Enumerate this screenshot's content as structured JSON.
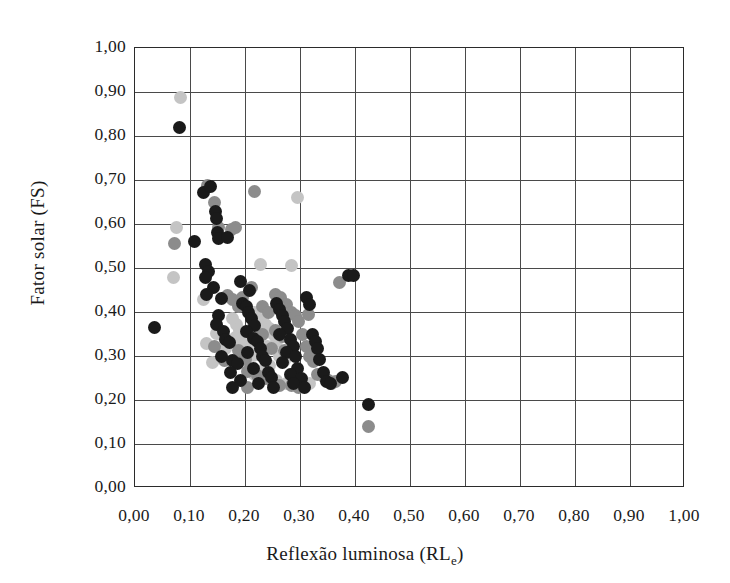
{
  "chart_data": {
    "type": "scatter",
    "title": "",
    "xlabel": "Reflexão luminosa (RL",
    "xlabel_sub": "e",
    "xlabel_suffix": ")",
    "ylabel": "Fator solar (FS)",
    "xlim": [
      0.0,
      1.0
    ],
    "ylim": [
      0.0,
      1.0
    ],
    "xticks": [
      "0,00",
      "0,10",
      "0,20",
      "0,30",
      "0,40",
      "0,50",
      "0,60",
      "0,70",
      "0,80",
      "0,90",
      "1,00"
    ],
    "yticks": [
      "0,00",
      "0,10",
      "0,20",
      "0,30",
      "0,40",
      "0,50",
      "0,60",
      "0,70",
      "0,80",
      "0,90",
      "1,00"
    ],
    "xtick_values": [
      0.0,
      0.1,
      0.2,
      0.3,
      0.4,
      0.5,
      0.6,
      0.7,
      0.8,
      0.9,
      1.0
    ],
    "ytick_values": [
      0.0,
      0.1,
      0.2,
      0.3,
      0.4,
      0.5,
      0.6,
      0.7,
      0.8,
      0.9,
      1.0
    ],
    "grid": true,
    "legend": "none",
    "marker_size_px": 13,
    "colors": {
      "dark": "#1a1a1a",
      "medium": "#8c8c8c",
      "light": "#c4c4c4",
      "grid": "#4a4a4a",
      "frame": "#2b2b2b",
      "background": "#ffffff"
    },
    "series": [
      {
        "name": "dark",
        "color": "#1a1a1a",
        "points": [
          [
            0.08,
            0.82
          ],
          [
            0.035,
            0.365
          ],
          [
            0.125,
            0.672
          ],
          [
            0.137,
            0.685
          ],
          [
            0.147,
            0.628
          ],
          [
            0.148,
            0.612
          ],
          [
            0.15,
            0.58
          ],
          [
            0.152,
            0.568
          ],
          [
            0.168,
            0.57
          ],
          [
            0.108,
            0.56
          ],
          [
            0.128,
            0.508
          ],
          [
            0.133,
            0.492
          ],
          [
            0.128,
            0.478
          ],
          [
            0.142,
            0.455
          ],
          [
            0.13,
            0.44
          ],
          [
            0.158,
            0.43
          ],
          [
            0.152,
            0.392
          ],
          [
            0.148,
            0.372
          ],
          [
            0.16,
            0.355
          ],
          [
            0.165,
            0.338
          ],
          [
            0.172,
            0.33
          ],
          [
            0.158,
            0.3
          ],
          [
            0.178,
            0.29
          ],
          [
            0.186,
            0.282
          ],
          [
            0.174,
            0.262
          ],
          [
            0.192,
            0.245
          ],
          [
            0.178,
            0.228
          ],
          [
            0.196,
            0.42
          ],
          [
            0.202,
            0.412
          ],
          [
            0.206,
            0.398
          ],
          [
            0.212,
            0.385
          ],
          [
            0.218,
            0.37
          ],
          [
            0.203,
            0.355
          ],
          [
            0.215,
            0.34
          ],
          [
            0.222,
            0.332
          ],
          [
            0.228,
            0.318
          ],
          [
            0.205,
            0.308
          ],
          [
            0.232,
            0.3
          ],
          [
            0.238,
            0.29
          ],
          [
            0.215,
            0.272
          ],
          [
            0.242,
            0.262
          ],
          [
            0.248,
            0.252
          ],
          [
            0.225,
            0.238
          ],
          [
            0.252,
            0.228
          ],
          [
            0.258,
            0.42
          ],
          [
            0.262,
            0.405
          ],
          [
            0.268,
            0.392
          ],
          [
            0.272,
            0.378
          ],
          [
            0.278,
            0.362
          ],
          [
            0.262,
            0.348
          ],
          [
            0.282,
            0.338
          ],
          [
            0.288,
            0.322
          ],
          [
            0.275,
            0.308
          ],
          [
            0.292,
            0.298
          ],
          [
            0.268,
            0.285
          ],
          [
            0.296,
            0.272
          ],
          [
            0.282,
            0.258
          ],
          [
            0.302,
            0.248
          ],
          [
            0.288,
            0.238
          ],
          [
            0.308,
            0.228
          ],
          [
            0.312,
            0.432
          ],
          [
            0.318,
            0.418
          ],
          [
            0.322,
            0.35
          ],
          [
            0.328,
            0.332
          ],
          [
            0.332,
            0.318
          ],
          [
            0.336,
            0.292
          ],
          [
            0.342,
            0.262
          ],
          [
            0.348,
            0.242
          ],
          [
            0.355,
            0.238
          ],
          [
            0.388,
            0.482
          ],
          [
            0.398,
            0.482
          ],
          [
            0.378,
            0.252
          ],
          [
            0.425,
            0.19
          ],
          [
            0.192,
            0.47
          ],
          [
            0.208,
            0.448
          ]
        ]
      },
      {
        "name": "medium",
        "color": "#8c8c8c",
        "points": [
          [
            0.072,
            0.555
          ],
          [
            0.132,
            0.688
          ],
          [
            0.145,
            0.648
          ],
          [
            0.218,
            0.675
          ],
          [
            0.152,
            0.592
          ],
          [
            0.176,
            0.588
          ],
          [
            0.182,
            0.592
          ],
          [
            0.195,
            0.432
          ],
          [
            0.188,
            0.412
          ],
          [
            0.168,
            0.438
          ],
          [
            0.178,
            0.428
          ],
          [
            0.212,
            0.455
          ],
          [
            0.232,
            0.412
          ],
          [
            0.243,
            0.4
          ],
          [
            0.255,
            0.44
          ],
          [
            0.265,
            0.432
          ],
          [
            0.276,
            0.418
          ],
          [
            0.285,
            0.398
          ],
          [
            0.292,
            0.392
          ],
          [
            0.298,
            0.378
          ],
          [
            0.255,
            0.358
          ],
          [
            0.268,
            0.345
          ],
          [
            0.232,
            0.348
          ],
          [
            0.248,
            0.318
          ],
          [
            0.272,
            0.312
          ],
          [
            0.305,
            0.35
          ],
          [
            0.312,
            0.322
          ],
          [
            0.318,
            0.3
          ],
          [
            0.325,
            0.288
          ],
          [
            0.332,
            0.258
          ],
          [
            0.345,
            0.252
          ],
          [
            0.352,
            0.245
          ],
          [
            0.358,
            0.238
          ],
          [
            0.365,
            0.242
          ],
          [
            0.205,
            0.265
          ],
          [
            0.222,
            0.255
          ],
          [
            0.238,
            0.248
          ],
          [
            0.252,
            0.238
          ],
          [
            0.262,
            0.232
          ],
          [
            0.285,
            0.232
          ],
          [
            0.298,
            0.228
          ],
          [
            0.188,
            0.312
          ],
          [
            0.2,
            0.292
          ],
          [
            0.162,
            0.29
          ],
          [
            0.145,
            0.322
          ],
          [
            0.372,
            0.468
          ],
          [
            0.425,
            0.14
          ],
          [
            0.205,
            0.228
          ],
          [
            0.315,
            0.395
          ]
        ]
      },
      {
        "name": "light",
        "color": "#c4c4c4",
        "points": [
          [
            0.082,
            0.888
          ],
          [
            0.076,
            0.592
          ],
          [
            0.07,
            0.478
          ],
          [
            0.295,
            0.66
          ],
          [
            0.228,
            0.508
          ],
          [
            0.285,
            0.505
          ],
          [
            0.125,
            0.428
          ],
          [
            0.218,
            0.4
          ],
          [
            0.226,
            0.392
          ],
          [
            0.232,
            0.382
          ],
          [
            0.238,
            0.372
          ],
          [
            0.214,
            0.365
          ],
          [
            0.222,
            0.355
          ],
          [
            0.21,
            0.345
          ],
          [
            0.202,
            0.335
          ],
          [
            0.196,
            0.345
          ],
          [
            0.19,
            0.358
          ],
          [
            0.184,
            0.372
          ],
          [
            0.178,
            0.385
          ],
          [
            0.245,
            0.362
          ],
          [
            0.252,
            0.348
          ],
          [
            0.258,
            0.332
          ],
          [
            0.24,
            0.322
          ],
          [
            0.228,
            0.312
          ],
          [
            0.215,
            0.302
          ],
          [
            0.205,
            0.318
          ],
          [
            0.192,
            0.33
          ],
          [
            0.182,
            0.342
          ],
          [
            0.172,
            0.332
          ],
          [
            0.165,
            0.318
          ],
          [
            0.158,
            0.348
          ],
          [
            0.148,
            0.352
          ],
          [
            0.262,
            0.298
          ],
          [
            0.272,
            0.29
          ],
          [
            0.245,
            0.278
          ],
          [
            0.232,
            0.268
          ],
          [
            0.218,
            0.258
          ],
          [
            0.292,
            0.255
          ],
          [
            0.305,
            0.245
          ],
          [
            0.318,
            0.238
          ],
          [
            0.275,
            0.238
          ],
          [
            0.258,
            0.245
          ],
          [
            0.14,
            0.285
          ],
          [
            0.13,
            0.328
          ]
        ]
      }
    ]
  }
}
